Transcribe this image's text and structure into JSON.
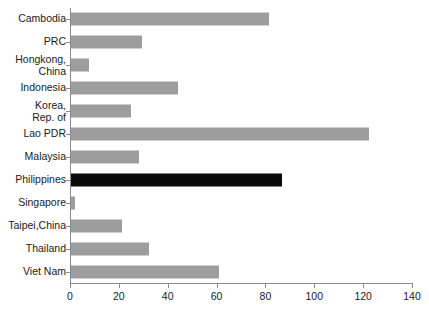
{
  "chart_data": {
    "type": "bar",
    "orientation": "horizontal",
    "title": "",
    "subtitle": "",
    "xlabel": "",
    "ylabel": "",
    "xlim": [
      0,
      140
    ],
    "ylim": null,
    "grid": false,
    "legend": null,
    "xticks": [
      0,
      20,
      40,
      60,
      80,
      100,
      120,
      140
    ],
    "xtick_labels": [
      "0",
      "20",
      "40",
      "60",
      "80",
      "100",
      "120",
      "140"
    ],
    "categories": [
      "Cambodia",
      "PRC",
      "Hongkong,\nChina",
      "Indonesia",
      "Korea,\nRep. of",
      "Lao PDR",
      "Malaysia",
      "Philippines",
      "Singapore",
      "Taipei,China",
      "Thailand",
      "Viet Nam"
    ],
    "values": [
      81,
      29,
      7.4,
      44,
      24.5,
      122,
      28,
      86.4,
      1.6,
      21,
      32,
      60.5
    ],
    "highlight_category": "Philippines",
    "colors": {
      "bar": "#9d9d9d",
      "bar_highlight": "#0a0a0a",
      "axis": "#8a8a8a",
      "text": "#1a1a1a",
      "background": "#ffffff"
    }
  }
}
